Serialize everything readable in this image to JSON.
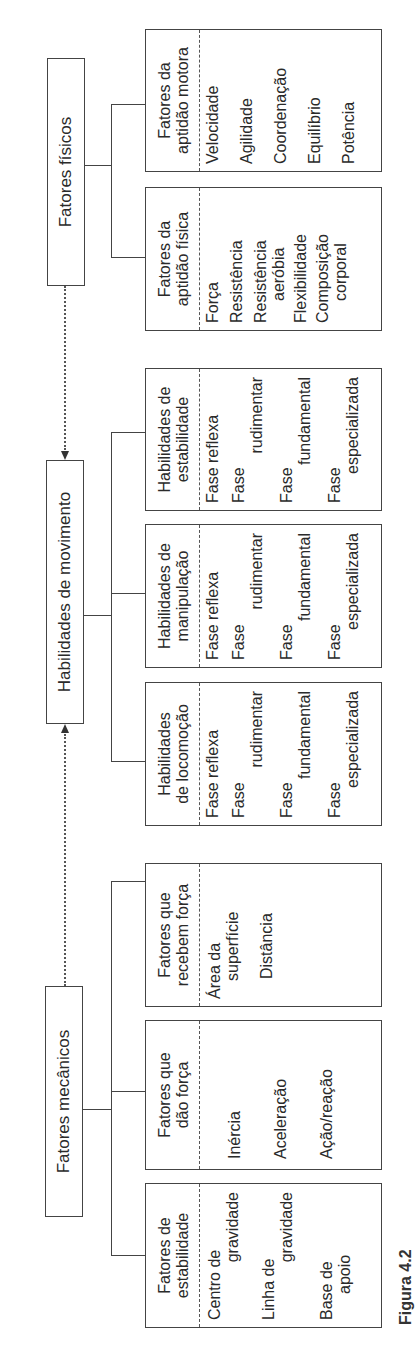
{
  "headers": {
    "mecanicos": "Fatores mecânicos",
    "movimento": "Habilidades de movimento",
    "fisicos": "Fatores físicos"
  },
  "groups": {
    "mecanicos": [
      {
        "title1": "Fatores de",
        "title2": "estabilidade",
        "items": [
          [
            "Centro de",
            "gravidade"
          ],
          [
            "Linha de",
            "gravidade"
          ],
          [
            "Base de",
            "apoio"
          ]
        ]
      },
      {
        "title1": "Fatores que",
        "title2": "dão força",
        "items": [
          [
            "Inércia"
          ],
          [
            "Aceleração"
          ],
          [
            "Ação/reação"
          ]
        ]
      },
      {
        "title1": "Fatores que",
        "title2": "recebem força",
        "items": [
          [
            "Área da",
            "superfície"
          ],
          [
            "Distância"
          ]
        ]
      }
    ],
    "movimento": [
      {
        "title1": "Habilidades",
        "title2": "de locomoção",
        "items": [
          [
            "Fase reflexa"
          ],
          [
            "Fase",
            "rudimentar"
          ],
          [
            "Fase",
            "fundamental"
          ],
          [
            "Fase",
            "especializada"
          ]
        ]
      },
      {
        "title1": "Habilidades de",
        "title2": "manipulação",
        "items": [
          [
            "Fase reflexa"
          ],
          [
            "Fase",
            "rudimentar"
          ],
          [
            "Fase",
            "fundamental"
          ],
          [
            "Fase",
            "especializada"
          ]
        ]
      },
      {
        "title1": "Habilidades de",
        "title2": "estabilidade",
        "items": [
          [
            "Fase reflexa"
          ],
          [
            "Fase",
            "rudimentar"
          ],
          [
            "Fase",
            "fundamental"
          ],
          [
            "Fase",
            "especializada"
          ]
        ]
      }
    ],
    "fisicos": [
      {
        "title1": "Fatores da",
        "title2": "aptidão física",
        "items": [
          [
            "Força"
          ],
          [
            "Resistência"
          ],
          [
            "Resistência",
            "aeróbia"
          ],
          [
            "Flexibilidade"
          ],
          [
            "Composição",
            "corporal"
          ]
        ]
      },
      {
        "title1": "Fatores da",
        "title2": "aptidão motora",
        "items": [
          [
            "Velocidade"
          ],
          [
            "Agilidade"
          ],
          [
            "Coordenação"
          ],
          [
            "Equilíbrio"
          ],
          [
            "Potência"
          ]
        ]
      }
    ]
  },
  "caption": "Figura 4.2"
}
